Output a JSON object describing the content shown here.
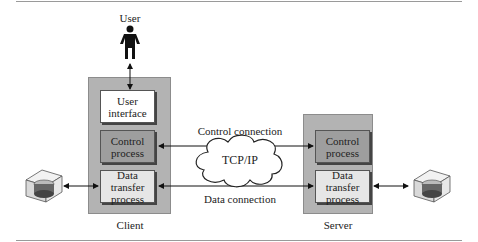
{
  "user": {
    "label": "User"
  },
  "client": {
    "label": "Client",
    "user_interface": [
      "User",
      "interface"
    ],
    "control_process": [
      "Control",
      "process"
    ],
    "data_transfer_process": [
      "Data transfer",
      "process"
    ]
  },
  "server": {
    "label": "Server",
    "control_process": [
      "Control",
      "process"
    ],
    "data_transfer_process": [
      "Data transfer",
      "process"
    ]
  },
  "network": {
    "cloud_label": "TCP/IP",
    "control_connection": "Control connection",
    "data_connection": "Data connection"
  },
  "icons": {
    "user": "person-icon",
    "client_storage": "disk-drive-icon",
    "server_storage": "disk-drive-icon"
  },
  "colors": {
    "outer_box": "#b3b3b3",
    "control_box": "#9e9e9e",
    "data_box": "#e6e6e6",
    "ui_box": "#ffffff"
  }
}
